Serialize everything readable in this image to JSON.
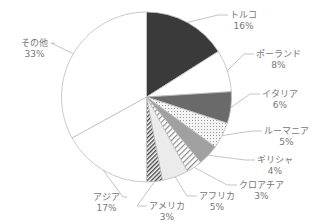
{
  "chart_data": {
    "type": "pie",
    "title": "",
    "start_angle_deg": 0,
    "direction": "clockwise",
    "slices": [
      {
        "label": "トルコ",
        "value": 16,
        "display": "16%",
        "fill": "#3a3a3a",
        "pattern": "solid"
      },
      {
        "label": "ポーランド",
        "value": 8,
        "display": "8%",
        "fill": "#ffffff",
        "pattern": "solid"
      },
      {
        "label": "イタリア",
        "value": 6,
        "display": "6%",
        "fill": "#6a6a6a",
        "pattern": "solid"
      },
      {
        "label": "ルーマニア",
        "value": 5,
        "display": "5%",
        "fill": "#f0f0f0",
        "pattern": "dots"
      },
      {
        "label": "ギリシャ",
        "value": 4,
        "display": "4%",
        "fill": "#a0a0a0",
        "pattern": "solid"
      },
      {
        "label": "クロアチア",
        "value": 3,
        "display": "3%",
        "fill": "#ffffff",
        "pattern": "hatch-light"
      },
      {
        "label": "アフリカ",
        "value": 5,
        "display": "5%",
        "fill": "#ebebeb",
        "pattern": "solid"
      },
      {
        "label": "アメリカ",
        "value": 3,
        "display": "3%",
        "fill": "#ffffff",
        "pattern": "hatch-dense"
      },
      {
        "label": "アジア",
        "value": 17,
        "display": "17%",
        "fill": "#ffffff",
        "pattern": "solid"
      },
      {
        "label": "その他",
        "value": 33,
        "display": "33%",
        "fill": "#ffffff",
        "pattern": "solid"
      }
    ],
    "legend": "none",
    "labels_position": "outside-with-leader-lines"
  },
  "labels": [
    {
      "name": "トルコ",
      "pct": "16%",
      "x": 230,
      "y": 10
    },
    {
      "name": "ポーランド",
      "pct": "8%",
      "x": 256,
      "y": 49
    },
    {
      "name": "イタリア",
      "pct": "6%",
      "x": 262,
      "y": 89
    },
    {
      "name": "ルーマニア",
      "pct": "5%",
      "x": 264,
      "y": 126
    },
    {
      "name": "ギリシャ",
      "pct": "4%",
      "x": 257,
      "y": 155
    },
    {
      "name": "クロアチア",
      "pct": "3%",
      "x": 239,
      "y": 180
    },
    {
      "name": "アフリカ",
      "pct": "5%",
      "x": 199,
      "y": 191
    },
    {
      "name": "アメリカ",
      "pct": "3%",
      "x": 149,
      "y": 201
    },
    {
      "name": "アジア",
      "pct": "17%",
      "x": 93,
      "y": 192
    },
    {
      "name": "その他",
      "pct": "33%",
      "x": 21,
      "y": 38
    }
  ]
}
